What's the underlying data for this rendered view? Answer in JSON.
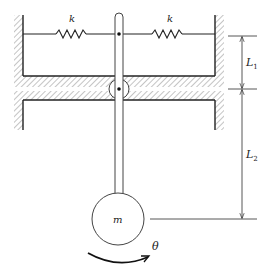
{
  "diagram": {
    "type": "mechanical-schematic",
    "labels": {
      "spring_left": "k",
      "spring_right": "k",
      "length_upper": "L",
      "length_upper_sub": "1",
      "length_lower": "L",
      "length_lower_sub": "2",
      "mass": "m",
      "angle": "θ"
    },
    "colors": {
      "line": "#222222",
      "hatch": "#8a8a8a",
      "background": "#ffffff"
    }
  }
}
